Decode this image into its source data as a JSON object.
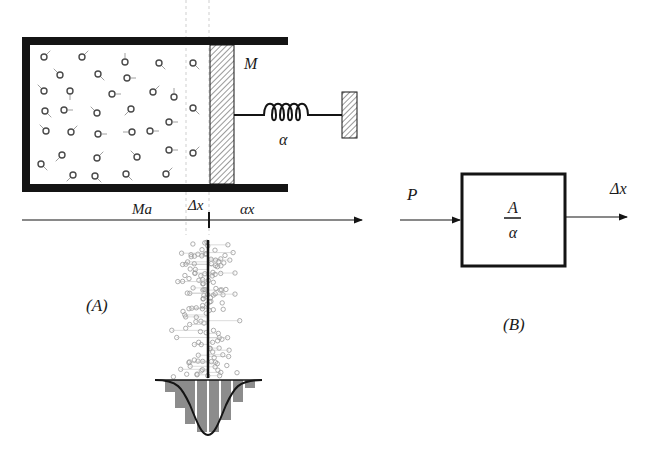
{
  "colors": {
    "ink": "#141414",
    "hatch": "#555555",
    "particle": "#4a4a4a",
    "scatter": "#9a9a9a",
    "histogram_bar": "#8c8c8c",
    "guide": "#cfcfcf"
  },
  "panel_a": {
    "caption": "(A)",
    "piston_label": "M",
    "spring_label": "α",
    "axis_labels": {
      "left": "Ma",
      "center": "Δx",
      "right": "αx"
    },
    "particles": [
      [
        44,
        57,
        "ur"
      ],
      [
        82,
        57,
        "ur"
      ],
      [
        125,
        62,
        "uu"
      ],
      [
        159,
        63,
        "dr"
      ],
      [
        193,
        63,
        "dr"
      ],
      [
        60,
        75,
        "ul"
      ],
      [
        98,
        74,
        "dr"
      ],
      [
        127,
        78,
        "r"
      ],
      [
        44,
        91,
        "ul"
      ],
      [
        70,
        91,
        "d"
      ],
      [
        112,
        94,
        "r"
      ],
      [
        153,
        92,
        "ur"
      ],
      [
        174,
        97,
        "u"
      ],
      [
        45,
        111,
        "dr"
      ],
      [
        64,
        110,
        "r"
      ],
      [
        97,
        113,
        "ul"
      ],
      [
        131,
        109,
        "dl"
      ],
      [
        193,
        108,
        "dr"
      ],
      [
        46,
        131,
        "ul"
      ],
      [
        71,
        132,
        "ur"
      ],
      [
        98,
        134,
        "r"
      ],
      [
        132,
        132,
        "l"
      ],
      [
        150,
        131,
        "r"
      ],
      [
        169,
        122,
        "r"
      ],
      [
        62,
        155,
        "dl"
      ],
      [
        97,
        158,
        "ur"
      ],
      [
        137,
        157,
        "ul"
      ],
      [
        169,
        150,
        "r"
      ],
      [
        193,
        153,
        "ur"
      ],
      [
        41,
        164,
        "dr"
      ],
      [
        73,
        175,
        "dl"
      ],
      [
        95,
        176,
        "dr"
      ],
      [
        126,
        174,
        "dr"
      ],
      [
        166,
        174,
        "ur"
      ]
    ],
    "histogram_bars": [
      {
        "x": 165,
        "h": 12
      },
      {
        "x": 175,
        "h": 28
      },
      {
        "x": 185,
        "h": 44
      },
      {
        "x": 197,
        "h": 52
      },
      {
        "x": 209,
        "h": 52
      },
      {
        "x": 221,
        "h": 40
      },
      {
        "x": 233,
        "h": 22
      },
      {
        "x": 245,
        "h": 8
      }
    ]
  },
  "panel_b": {
    "caption": "(B)",
    "input_label": "P",
    "output_label": "Δx",
    "transfer_numerator": "A",
    "transfer_denominator": "α"
  }
}
